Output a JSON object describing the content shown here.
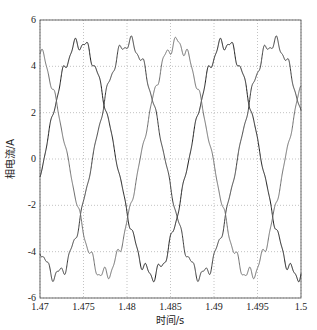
{
  "chart_data": {
    "type": "line",
    "title": "",
    "xlabel": "时间/s",
    "ylabel": "相电流/A",
    "xlim": [
      1.47,
      1.5
    ],
    "ylim": [
      -6,
      6
    ],
    "grid": true,
    "legend": null,
    "xticks": [
      1.47,
      1.475,
      1.48,
      1.485,
      1.49,
      1.495,
      1.5
    ],
    "xtick_labels": [
      "1.47",
      "1.475",
      "1.48",
      "1.485",
      "1.49",
      "1.495",
      "1.5"
    ],
    "yticks": [
      -6,
      -4,
      -2,
      0,
      2,
      4,
      6
    ],
    "ytick_labels": [
      "-6",
      "-4",
      "-2",
      "0",
      "2",
      "4",
      "6"
    ],
    "frequency_hz": 60,
    "series": [
      {
        "name": "phase-a",
        "amplitude": 5.0,
        "peak_time": 1.4746,
        "ripple": 0.35,
        "color": "#1a1a1a"
      },
      {
        "name": "phase-b",
        "amplitude": 5.0,
        "peak_time": 1.4802,
        "ripple": 0.35,
        "color": "#3a3a3a"
      },
      {
        "name": "phase-c",
        "amplitude": 5.0,
        "peak_time": 1.4857,
        "ripple": 0.35,
        "color": "#6e6e6e"
      }
    ],
    "sample_points": {
      "x": [
        1.47,
        1.475,
        1.48,
        1.485,
        1.49,
        1.495,
        1.5
      ],
      "phase-a": [
        -0.8,
        4.9,
        -0.1,
        -4.9,
        1.0,
        4.6,
        -1.8
      ],
      "phase-b": [
        -3.9,
        -2.4,
        4.9,
        -2.6,
        -2.6,
        4.8,
        -2.9
      ],
      "phase-c": [
        4.7,
        -2.5,
        -4.8,
        4.9,
        -1.8,
        -3.4,
        4.7
      ]
    }
  },
  "layout": {
    "plot": {
      "left": 40,
      "right": 301,
      "top": 20,
      "bottom": 298
    }
  }
}
